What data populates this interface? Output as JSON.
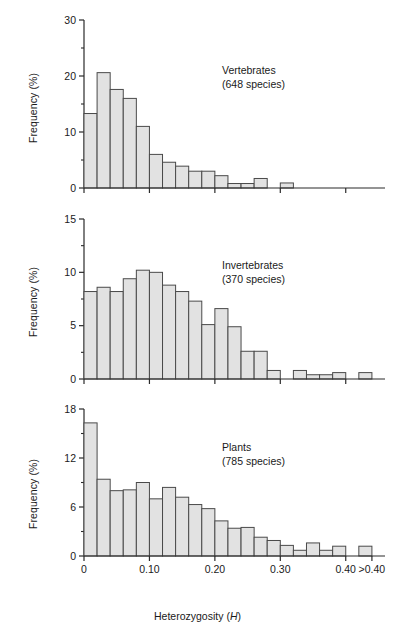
{
  "figure": {
    "axis_title_x": "Heterozygosity (",
    "axis_title_x_italic": "H",
    "axis_title_x_close": ")",
    "ylabel": "Frequency (%)",
    "bar_fill": "#e2e2e2",
    "bar_stroke": "#4a4a4a",
    "axis_color": "#2b2b2b"
  },
  "chart_data": [
    {
      "type": "bar",
      "name": "vertebrates",
      "title": "Vertebrates",
      "subtitle": "(648 species)",
      "xlabel": "Heterozygosity (H)",
      "ylabel": "Frequency (%)",
      "ylim": [
        0,
        30
      ],
      "yticks": [
        0,
        10,
        20,
        30
      ],
      "ytick_labels": [
        "0",
        "10",
        "20",
        "30"
      ],
      "yminor_step": 5,
      "xlim": [
        0,
        0.46
      ],
      "xticks": [
        0,
        0.1,
        0.2,
        0.3,
        0.4
      ],
      "xtick_labels": [
        "0",
        "0.10",
        "0.20",
        "0.30",
        "0.40",
        ">0.40"
      ],
      "bin_width": 0.02,
      "grid": false,
      "bin_starts": [
        0.0,
        0.02,
        0.04,
        0.06,
        0.08,
        0.1,
        0.12,
        0.14,
        0.16,
        0.18,
        0.2,
        0.22,
        0.24,
        0.26,
        0.28,
        0.3,
        0.32,
        0.34,
        0.36,
        0.38,
        0.42
      ],
      "values": [
        13.3,
        20.6,
        17.6,
        16.0,
        11.0,
        6.0,
        4.6,
        3.9,
        3.0,
        3.0,
        2.2,
        0.8,
        0.8,
        1.7,
        0.0,
        0.9,
        0.0,
        0.0,
        0.0,
        0.0,
        0.0
      ]
    },
    {
      "type": "bar",
      "name": "invertebrates",
      "title": "Invertebrates",
      "subtitle": "(370 species)",
      "xlabel": "Heterozygosity (H)",
      "ylabel": "Frequency (%)",
      "ylim": [
        0,
        15
      ],
      "yticks": [
        0,
        5,
        10,
        15
      ],
      "ytick_labels": [
        "0",
        "5",
        "10",
        "15"
      ],
      "yminor_step": 2.5,
      "xlim": [
        0,
        0.46
      ],
      "xticks": [
        0,
        0.1,
        0.2,
        0.3,
        0.4
      ],
      "xtick_labels": [
        "0",
        "0.10",
        "0.20",
        "0.30",
        "0.40",
        ">0.40"
      ],
      "bin_width": 0.02,
      "grid": false,
      "bin_starts": [
        0.0,
        0.02,
        0.04,
        0.06,
        0.08,
        0.1,
        0.12,
        0.14,
        0.16,
        0.18,
        0.2,
        0.22,
        0.24,
        0.26,
        0.28,
        0.3,
        0.32,
        0.34,
        0.36,
        0.38,
        0.42
      ],
      "values": [
        8.2,
        8.6,
        8.2,
        9.4,
        10.2,
        10.0,
        8.8,
        8.2,
        7.3,
        5.1,
        6.6,
        4.9,
        2.6,
        2.6,
        0.8,
        0.0,
        0.8,
        0.4,
        0.4,
        0.6,
        0.6
      ]
    },
    {
      "type": "bar",
      "name": "plants",
      "title": "Plants",
      "subtitle": "(785 species)",
      "xlabel": "Heterozygosity (H)",
      "ylabel": "Frequency (%)",
      "ylim": [
        0,
        18
      ],
      "yticks": [
        0,
        6,
        12,
        18
      ],
      "ytick_labels": [
        "0",
        "6",
        "12",
        "18"
      ],
      "yminor_step": 3,
      "xlim": [
        0,
        0.46
      ],
      "xticks": [
        0,
        0.1,
        0.2,
        0.3,
        0.4
      ],
      "xtick_labels": [
        "0",
        "0.10",
        "0.20",
        "0.30",
        "0.40",
        ">0.40"
      ],
      "bin_width": 0.02,
      "grid": false,
      "bin_starts": [
        0.0,
        0.02,
        0.04,
        0.06,
        0.08,
        0.1,
        0.12,
        0.14,
        0.16,
        0.18,
        0.2,
        0.22,
        0.24,
        0.26,
        0.28,
        0.3,
        0.32,
        0.34,
        0.36,
        0.38,
        0.42
      ],
      "values": [
        16.3,
        9.4,
        8.0,
        8.1,
        9.0,
        7.0,
        8.4,
        7.2,
        6.3,
        5.8,
        4.3,
        3.4,
        3.5,
        2.3,
        1.9,
        1.3,
        0.7,
        1.6,
        0.7,
        1.2,
        1.2
      ]
    }
  ]
}
